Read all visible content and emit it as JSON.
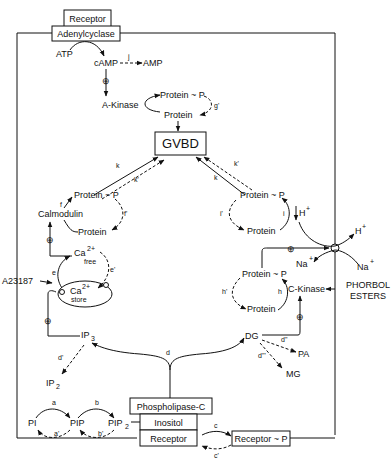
{
  "diagram": {
    "boxes": {
      "receptor_top": "Receptor",
      "adenylcyclase": "Adenylcyclase",
      "gvbd": "GVBD",
      "phospholipase": "Phospholipase-C",
      "inositol": "Inositol",
      "receptor_bottom": "Receptor",
      "receptor_p": "Receptor ~ P"
    },
    "nodes": {
      "atp": "ATP",
      "camp": "cAMP",
      "amp": "AMP",
      "a_kinase": "A-Kinase",
      "protein_p_g": "Protein ~ P",
      "protein_g": "Protein",
      "protein_p_f": "Protein ~ P",
      "protein_f": "Protein",
      "calmodulin": "Calmodulin",
      "ca_free": "Ca",
      "ca_free_sup": "2+",
      "ca_free_sub": "free",
      "ca_store": "Ca",
      "ca_store_sup": "2+",
      "ca_store_sub": "store",
      "a23187": "A23187",
      "ip3": "IP",
      "ip3_sub": "3",
      "ip2": "IP",
      "ip2_sub": "2",
      "protein_p_i": "Protein ~ P",
      "protein_i": "Protein",
      "h_plus_in": "H",
      "h_plus_out": "H",
      "na_plus_in": "Na",
      "na_plus_out": "Na",
      "plus_sup": "+",
      "phorbol_1": "PHORBOL",
      "phorbol_2": "ESTERS",
      "protein_p_h": "Protein ~ P",
      "protein_h": "Protein",
      "c_kinase": "C-Kinase",
      "dg": "DG",
      "pa": "PA",
      "mg": "MG",
      "pi": "PI",
      "pip": "PIP",
      "pip2": "PIP",
      "pip2_sub": "2"
    },
    "reaction_labels": {
      "a": "a",
      "a_rev": "a'",
      "b": "b",
      "b_rev": "b'",
      "c": "c",
      "c_rev": "c'",
      "d": "d",
      "d_rev": "d'",
      "d2": "d\"",
      "d3": "d\"'",
      "e": "e",
      "e_rev": "e'",
      "f": "f",
      "f_rev": "f'",
      "g_rev": "g'",
      "h": "h",
      "h_rev": "h'",
      "i": "i",
      "i_rev": "i'",
      "j": "j",
      "k_left": "k",
      "k_left_rev": "k'",
      "k_right": "k",
      "k_right_rev": "k'"
    },
    "stimulation_symbol": "⊕"
  }
}
